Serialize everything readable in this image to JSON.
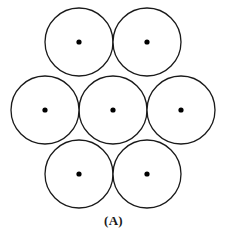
{
  "figure": {
    "label": "(A)",
    "label_x": 113,
    "label_y": 213,
    "width": 227,
    "height": 238,
    "background_color": "#ffffff",
    "stroke_color": "#1a1a1a",
    "fill_color": "#ffffff",
    "dot_color": "#000000",
    "stroke_width": 1.3,
    "circle_radius": 34,
    "dot_radius": 2.6
  },
  "chart_data": {
    "type": "scatter",
    "title": "(A)",
    "subtitle": "",
    "xlabel": "",
    "ylabel": "",
    "grid": false,
    "legend_position": "none",
    "xlim": [
      0,
      227
    ],
    "ylim": [
      238,
      0
    ],
    "shape": "circle",
    "radius": 34,
    "categories": [
      "center",
      "middle-left",
      "middle-right",
      "top-left",
      "top-right",
      "bottom-left",
      "bottom-right"
    ],
    "points": [
      {
        "name": "center",
        "cx": 113,
        "cy": 110,
        "r": 34
      },
      {
        "name": "middle-left",
        "cx": 45,
        "cy": 110,
        "r": 34
      },
      {
        "name": "middle-right",
        "cx": 181,
        "cy": 110,
        "r": 34
      },
      {
        "name": "top-left",
        "cx": 79,
        "cy": 42,
        "r": 34
      },
      {
        "name": "top-right",
        "cx": 147,
        "cy": 42,
        "r": 34
      },
      {
        "name": "bottom-left",
        "cx": 79,
        "cy": 174,
        "r": 34
      },
      {
        "name": "bottom-right",
        "cx": 147,
        "cy": 174,
        "r": 34
      }
    ],
    "annotations": [
      {
        "text": "(A)",
        "x": 113,
        "y": 220
      }
    ]
  }
}
